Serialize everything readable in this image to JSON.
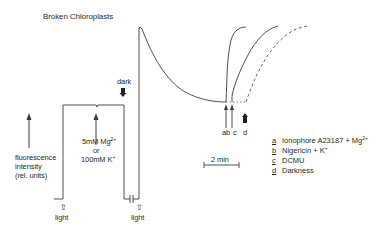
{
  "figure": {
    "title": "Broken Chloroplasts",
    "y_axis_label": {
      "line1": "fluorescence",
      "line2": "intensity",
      "line3": "(rel. units)"
    },
    "annotations": {
      "addition_line1": "5mM Mg",
      "addition_line1_sup": "2+",
      "addition_or": "or",
      "addition_line3": "100mM K",
      "addition_line3_sup": "+",
      "dark": "dark",
      "light_1": "light",
      "light_2": "light",
      "light_arrow_icon": "⇧",
      "scale_bar": "2 min",
      "marker_ab": "ab",
      "marker_c": "c",
      "marker_d": "d"
    },
    "legend": [
      {
        "key": "a",
        "text": "Ionophore A23187 + Mg",
        "sup": "2+"
      },
      {
        "key": "b",
        "text": "Nigericin + K",
        "sup": "+"
      },
      {
        "key": "c",
        "text": "DCMU",
        "sup": ""
      },
      {
        "key": "d",
        "text": "Darkness",
        "sup": ""
      }
    ],
    "colors": {
      "line": "#3a3a3a",
      "text": "#2a2a2a",
      "background": "#ffffff"
    }
  }
}
